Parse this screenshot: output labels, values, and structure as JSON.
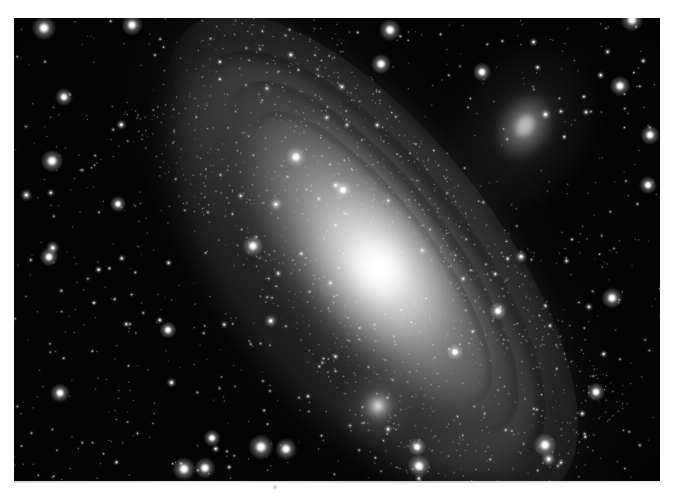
{
  "page": {
    "background_color": "#ffffff",
    "width": 673,
    "height": 494,
    "kind": "astronomical-photograph"
  },
  "photo": {
    "subject": "Andromeda Galaxy",
    "frame": {
      "x": 14,
      "y": 18,
      "width": 646,
      "height": 463
    },
    "background_color": "#030303",
    "palette": {
      "sky": "#030303",
      "core": "#ffffff",
      "disk_inner": "#d8d8d8",
      "disk_mid": "#8a8a8a",
      "disk_outer": "#3a3a3a",
      "dust_lane": "#0c0c0c",
      "star": "#f2f2f2"
    }
  },
  "objects": {
    "galaxy_core": {
      "label": "M31 nucleus",
      "cx": 378,
      "cy": 268,
      "radius": 34,
      "brightness": 1.0
    },
    "galaxy_disk": {
      "label": "M31 disk",
      "cx": 372,
      "cy": 258,
      "semi_major": 300,
      "semi_minor": 96,
      "position_angle_deg": 52
    },
    "companions": [
      {
        "label": "M110",
        "cx": 525,
        "cy": 126,
        "rx": 26,
        "ry": 34,
        "angle_deg": 30,
        "brightness": 0.55
      },
      {
        "label": "M32",
        "cx": 378,
        "cy": 406,
        "rx": 13,
        "ry": 13,
        "angle_deg": 0,
        "brightness": 0.95
      }
    ],
    "dust_lanes": [
      {
        "label": "outer dust lane",
        "offset": 1.0,
        "opacity": 0.78
      },
      {
        "label": "mid dust lane",
        "offset": 0.78,
        "opacity": 0.6
      },
      {
        "label": "inner dust lane",
        "offset": 0.58,
        "opacity": 0.42
      }
    ]
  },
  "starfield": {
    "count": 1180,
    "seed": 20240611,
    "bright_stars": [
      {
        "x": 44,
        "y": 28,
        "r": 3.0
      },
      {
        "x": 132,
        "y": 25,
        "r": 2.6
      },
      {
        "x": 64,
        "y": 97,
        "r": 2.2
      },
      {
        "x": 52,
        "y": 161,
        "r": 2.8
      },
      {
        "x": 49,
        "y": 257,
        "r": 2.3
      },
      {
        "x": 60,
        "y": 393,
        "r": 2.4
      },
      {
        "x": 184,
        "y": 469,
        "r": 2.9
      },
      {
        "x": 205,
        "y": 468,
        "r": 2.6
      },
      {
        "x": 261,
        "y": 447,
        "r": 3.1
      },
      {
        "x": 286,
        "y": 449,
        "r": 2.7
      },
      {
        "x": 419,
        "y": 466,
        "r": 2.8
      },
      {
        "x": 417,
        "y": 447,
        "r": 2.2
      },
      {
        "x": 545,
        "y": 445,
        "r": 2.9
      },
      {
        "x": 390,
        "y": 30,
        "r": 2.7
      },
      {
        "x": 381,
        "y": 64,
        "r": 2.5
      },
      {
        "x": 482,
        "y": 72,
        "r": 2.3
      },
      {
        "x": 632,
        "y": 20,
        "r": 2.8
      },
      {
        "x": 620,
        "y": 86,
        "r": 2.5
      },
      {
        "x": 650,
        "y": 135,
        "r": 2.4
      },
      {
        "x": 648,
        "y": 185,
        "r": 2.2
      },
      {
        "x": 296,
        "y": 157,
        "r": 2.6
      },
      {
        "x": 253,
        "y": 246,
        "r": 2.6
      },
      {
        "x": 343,
        "y": 190,
        "r": 2.3
      },
      {
        "x": 612,
        "y": 298,
        "r": 2.6
      },
      {
        "x": 596,
        "y": 392,
        "r": 2.3
      },
      {
        "x": 212,
        "y": 438,
        "r": 2.1
      },
      {
        "x": 118,
        "y": 204,
        "r": 2.0
      },
      {
        "x": 168,
        "y": 330,
        "r": 2.1
      },
      {
        "x": 498,
        "y": 311,
        "r": 2.2
      },
      {
        "x": 455,
        "y": 352,
        "r": 2.0
      }
    ]
  },
  "artifacts": {
    "bottom_edge_streak": true,
    "dust_speck": {
      "x": 273,
      "y": 485
    }
  }
}
